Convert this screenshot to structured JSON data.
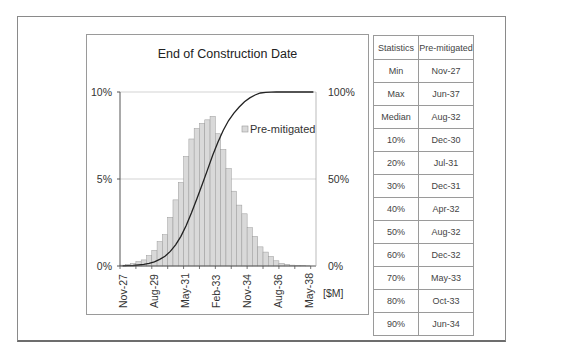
{
  "chart_data": {
    "type": "bar",
    "title": "End of Construction Date",
    "xlabel": "[$M]",
    "ylabel_left": "",
    "ylabel_right": "",
    "x_tick_labels": [
      "Nov-27",
      "Aug-29",
      "May-31",
      "Feb-33",
      "Nov-34",
      "Aug-36",
      "May-38"
    ],
    "y_left_ticks": [
      "0%",
      "5%",
      "10%"
    ],
    "y_right_ticks": [
      "0%",
      "50%",
      "100%"
    ],
    "ylim_left": [
      0,
      10
    ],
    "ylim_right": [
      0,
      100
    ],
    "grid": "horizontal at 5% and 10%",
    "legend": {
      "position": "inside upper right",
      "entries": [
        "Pre-mitigated"
      ]
    },
    "series": [
      {
        "name": "Pre-mitigated",
        "type": "bar",
        "axis": "left",
        "values": [
          0.05,
          0.1,
          0.15,
          0.25,
          0.35,
          0.6,
          0.9,
          1.4,
          1.8,
          2.8,
          3.8,
          4.8,
          6.3,
          7.3,
          7.9,
          8.2,
          8.4,
          8.6,
          7.6,
          6.7,
          5.6,
          4.3,
          3.5,
          3.0,
          2.2,
          1.7,
          1.1,
          0.8,
          0.55,
          0.3,
          0.15,
          0.1,
          0.05,
          0.03,
          0.02,
          0.01,
          0.0
        ]
      },
      {
        "name": "Cumulative (S-curve)",
        "type": "line",
        "axis": "right",
        "values": [
          0.05,
          0.15,
          0.3,
          0.55,
          0.9,
          1.5,
          2.4,
          3.8,
          5.6,
          8.4,
          12.2,
          17.0,
          23.3,
          30.6,
          38.5,
          46.7,
          55.1,
          63.7,
          71.3,
          78.0,
          83.6,
          87.9,
          91.4,
          94.4,
          96.6,
          98.3,
          99.4,
          99.8,
          99.9,
          100,
          100,
          100,
          100,
          100,
          100,
          100,
          100
        ]
      }
    ]
  },
  "chart": {
    "title": "End of Construction Date",
    "legend_label": "Pre-mitigated",
    "x_unit_label": "[$M]",
    "left_ticks": {
      "t0": "0%",
      "t5": "5%",
      "t10": "10%"
    },
    "right_ticks": {
      "t0": "0%",
      "t50": "50%",
      "t100": "100%"
    },
    "x_labels": [
      "Nov-27",
      "Aug-29",
      "May-31",
      "Feb-33",
      "Nov-34",
      "Aug-36",
      "May-38"
    ],
    "colors": {
      "bar_fill": "#d9d9d9",
      "bar_stroke": "#9a9a9a",
      "line": "#222222",
      "grid": "#c8c8c8"
    }
  },
  "table": {
    "headers": [
      "Statistics",
      "Pre-mitigated"
    ],
    "rows": [
      [
        "Min",
        "Nov-27"
      ],
      [
        "Max",
        "Jun-37"
      ],
      [
        "Median",
        "Aug-32"
      ],
      [
        "10%",
        "Dec-30"
      ],
      [
        "20%",
        "Jul-31"
      ],
      [
        "30%",
        "Dec-31"
      ],
      [
        "40%",
        "Apr-32"
      ],
      [
        "50%",
        "Aug-32"
      ],
      [
        "60%",
        "Dec-32"
      ],
      [
        "70%",
        "May-33"
      ],
      [
        "80%",
        "Oct-33"
      ],
      [
        "90%",
        "Jun-34"
      ]
    ]
  }
}
